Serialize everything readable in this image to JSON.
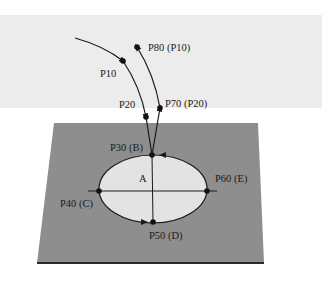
{
  "diagram": {
    "colors": {
      "background": "#ffffff",
      "band": "#ececec",
      "plate": "#8e8e8e",
      "plate_edge": "#2a2a2a",
      "region_fill": "#e3e3e3",
      "line": "#1a1a1a"
    },
    "region_label": "A",
    "points": [
      {
        "id": "p10",
        "label": "P10",
        "x": 123,
        "y": 61
      },
      {
        "id": "p20",
        "label": "P20",
        "x": 146,
        "y": 117
      },
      {
        "id": "p30",
        "label": "P30 (B)",
        "x": 152,
        "y": 155
      },
      {
        "id": "p40",
        "label": "P40 (C)",
        "x": 99,
        "y": 191
      },
      {
        "id": "p50",
        "label": "P50 (D)",
        "x": 153,
        "y": 222
      },
      {
        "id": "p60",
        "label": "P60 (E)",
        "x": 207,
        "y": 191
      },
      {
        "id": "p70",
        "label": "P70 (P20)",
        "x": 160,
        "y": 108
      },
      {
        "id": "p80",
        "label": "P80 (P10)",
        "x": 137,
        "y": 47
      }
    ]
  }
}
